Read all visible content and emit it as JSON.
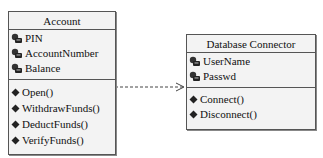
{
  "diagram": {
    "type": "UML class diagram",
    "classes": [
      {
        "name": "Account",
        "attributes": [
          "PIN",
          "AccountNumber",
          "Balance"
        ],
        "operations": [
          "Open()",
          "WithdrawFunds()",
          "DeductFunds()",
          "VerifyFunds()"
        ]
      },
      {
        "name": "Database Connector",
        "attributes": [
          "UserName",
          "Passwd"
        ],
        "operations": [
          "Connect()",
          "Disconnect()"
        ]
      }
    ],
    "relationships": [
      {
        "from": "Account",
        "to": "Database Connector",
        "type": "dependency",
        "style": "dashed-open-arrow"
      }
    ]
  }
}
